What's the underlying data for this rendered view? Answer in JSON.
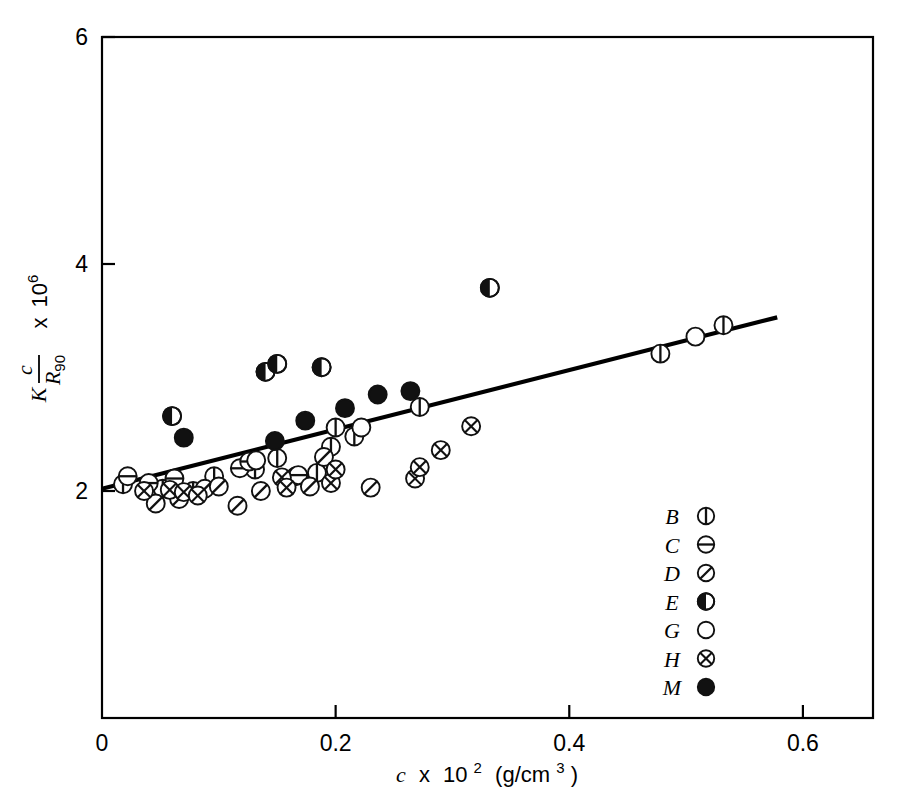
{
  "chart_data": {
    "type": "scatter",
    "title": "",
    "xlabel": "c x 10² (g/cm³)",
    "ylabel": "K c/R₉₀ x 10⁶",
    "xlabel_parts": {
      "var": "c",
      "times": "x",
      "base": "10",
      "exp": "2",
      "units": "(g/cm",
      "units_exp": "3",
      "units_close": ")"
    },
    "ylabel_parts": {
      "k": "K",
      "num": "c",
      "den": "R",
      "den_sub": "90",
      "times": "x",
      "base": "10",
      "exp": "6"
    },
    "xlim": [
      0,
      0.66
    ],
    "ylim": [
      0.0,
      6.0
    ],
    "xticks": [
      0,
      0.2,
      0.4,
      0.6
    ],
    "xticklabels": [
      "0",
      "0.2",
      "0.4",
      "0.6"
    ],
    "yticks": [
      2,
      4,
      6
    ],
    "yticklabels": [
      "2",
      "4",
      "6"
    ],
    "grid": false,
    "legend_position": "lower-right",
    "legend": [
      {
        "name": "B",
        "marker": "circle-vline"
      },
      {
        "name": "C",
        "marker": "circle-hline"
      },
      {
        "name": "D",
        "marker": "circle-diagline"
      },
      {
        "name": "E",
        "marker": "circle-left-half"
      },
      {
        "name": "G",
        "marker": "circle-open"
      },
      {
        "name": "H",
        "marker": "circle-cross"
      },
      {
        "name": "M",
        "marker": "circle-filled"
      }
    ],
    "trendline": {
      "x": [
        0.0,
        0.578
      ],
      "y": [
        2.02,
        3.53
      ],
      "label": "least-squares fit"
    },
    "series": [
      {
        "name": "B",
        "marker": "circle-vline",
        "points": [
          [
            0.018,
            2.06
          ],
          [
            0.052,
            2.02
          ],
          [
            0.078,
            2.0
          ],
          [
            0.096,
            2.13
          ],
          [
            0.128,
            2.23
          ],
          [
            0.131,
            2.19
          ],
          [
            0.15,
            2.29
          ],
          [
            0.166,
            2.13
          ],
          [
            0.184,
            2.16
          ],
          [
            0.196,
            2.39
          ],
          [
            0.2,
            2.56
          ],
          [
            0.216,
            2.48
          ],
          [
            0.272,
            2.74
          ],
          [
            0.478,
            3.21
          ],
          [
            0.532,
            3.46
          ]
        ]
      },
      {
        "name": "C",
        "marker": "circle-hline",
        "points": [
          [
            0.022,
            2.13
          ],
          [
            0.04,
            2.07
          ],
          [
            0.062,
            2.11
          ],
          [
            0.118,
            2.2
          ],
          [
            0.126,
            2.26
          ],
          [
            0.168,
            2.14
          ]
        ]
      },
      {
        "name": "D",
        "marker": "circle-diagline",
        "points": [
          [
            0.046,
            1.89
          ],
          [
            0.066,
            1.93
          ],
          [
            0.088,
            2.02
          ],
          [
            0.1,
            2.04
          ],
          [
            0.116,
            1.87
          ],
          [
            0.136,
            2.0
          ],
          [
            0.178,
            2.04
          ],
          [
            0.19,
            2.3
          ],
          [
            0.23,
            2.03
          ]
        ]
      },
      {
        "name": "E",
        "marker": "circle-left-half",
        "points": [
          [
            0.06,
            2.66
          ],
          [
            0.14,
            3.05
          ],
          [
            0.15,
            3.12
          ],
          [
            0.188,
            3.09
          ],
          [
            0.332,
            3.79
          ]
        ]
      },
      {
        "name": "G",
        "marker": "circle-open",
        "points": [
          [
            0.132,
            2.27
          ],
          [
            0.222,
            2.56
          ],
          [
            0.508,
            3.36
          ]
        ]
      },
      {
        "name": "H",
        "marker": "circle-cross",
        "points": [
          [
            0.036,
            2.0
          ],
          [
            0.058,
            2.01
          ],
          [
            0.07,
            1.99
          ],
          [
            0.082,
            1.96
          ],
          [
            0.154,
            2.12
          ],
          [
            0.158,
            2.03
          ],
          [
            0.196,
            2.07
          ],
          [
            0.2,
            2.19
          ],
          [
            0.268,
            2.11
          ],
          [
            0.272,
            2.21
          ],
          [
            0.29,
            2.36
          ],
          [
            0.316,
            2.57
          ]
        ]
      },
      {
        "name": "M",
        "marker": "circle-filled",
        "points": [
          [
            0.07,
            2.47
          ],
          [
            0.148,
            2.44
          ],
          [
            0.174,
            2.62
          ],
          [
            0.208,
            2.73
          ],
          [
            0.236,
            2.85
          ],
          [
            0.264,
            2.88
          ]
        ]
      }
    ]
  },
  "colors": {
    "axis": "#000000",
    "marker": "#1a1a1a",
    "line": "#000000",
    "background": "#ffffff"
  }
}
